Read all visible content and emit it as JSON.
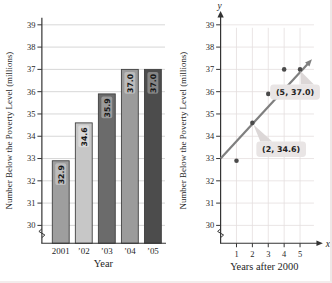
{
  "colors": {
    "axis": "#333333",
    "grid_left": "#cccccc",
    "grid_right": "#e4dede",
    "trend_line": "#7f7f7f",
    "point": "#4a4a4a",
    "callout_bg": "#e9e5e5",
    "callout_wedge": "#dcd7d7",
    "bar_outline": "#3f3f3f"
  },
  "chart_data": [
    {
      "type": "bar",
      "ylabel": "Number Below the Poverty Level (millions)",
      "xlabel": "Year",
      "categories": [
        "2001",
        "’02",
        "’03",
        "’04",
        "’05"
      ],
      "values": [
        32.9,
        34.6,
        35.9,
        37.0,
        37.0
      ],
      "bar_labels": [
        "32.9",
        "34.6",
        "35.9",
        "37.0",
        "37.0"
      ],
      "bar_colors": [
        "#9e9e9e",
        "#c7c7c7",
        "#6b6b6b",
        "#9b9b9b",
        "#4c4c4c"
      ],
      "y_ticks": [
        30,
        31,
        32,
        33,
        34,
        35,
        36,
        37,
        38,
        39
      ],
      "ylim": [
        30,
        39
      ],
      "axis_break": true,
      "grid": "horizontal"
    },
    {
      "type": "scatter",
      "ylabel": "Number Below the Poverty Level (millions)",
      "xlabel": "Years after 2000",
      "y_axis_symbol": "y",
      "x_axis_symbol": "x",
      "x_ticks": [
        1,
        2,
        3,
        4,
        5
      ],
      "y_ticks": [
        30,
        31,
        32,
        33,
        34,
        35,
        36,
        37,
        38,
        39
      ],
      "xlim": [
        0,
        5.8
      ],
      "ylim": [
        30,
        39
      ],
      "points": [
        [
          1,
          32.9
        ],
        [
          2,
          34.6
        ],
        [
          3,
          35.9
        ],
        [
          4,
          37.0
        ],
        [
          5,
          37.0
        ]
      ],
      "trend_line": {
        "from": [
          0,
          33.0
        ],
        "to": [
          5.75,
          37.45
        ]
      },
      "annotations": [
        {
          "text": "(2, 34.6)",
          "point": [
            2,
            34.6
          ]
        },
        {
          "text": "(5, 37.0)",
          "point": [
            5,
            37.0
          ]
        }
      ],
      "axis_break": true,
      "grid": "both"
    }
  ]
}
